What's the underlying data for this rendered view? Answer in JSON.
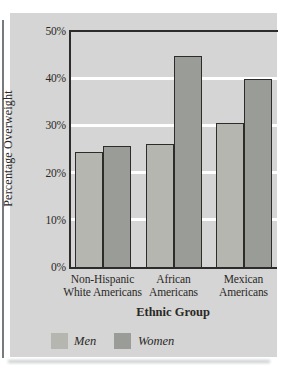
{
  "figure": {
    "y_axis_title": "Percentage Overweight",
    "x_axis_title": "Ethnic Group"
  },
  "colors": {
    "panel_background": "#d4d5d4",
    "men_bar": "#b4b6af",
    "women_bar": "#9a9c97",
    "bar_outline": "#2d2c2a",
    "axis_line": "#2d2c2a",
    "gridline": "#ffffff",
    "text": "#2b2826"
  },
  "chart_data": {
    "type": "bar",
    "title": "",
    "categories": [
      "Non-Hispanic White Americans",
      "African Americans",
      "Mexican Americans"
    ],
    "category_label_lines": [
      [
        "Non-Hispanic",
        "White Americans"
      ],
      [
        "African",
        "Americans"
      ],
      [
        "Mexican",
        "Americans"
      ]
    ],
    "series": [
      {
        "name": "Men",
        "color": "#b4b6af",
        "values": [
          24.3,
          26.0,
          30.5
        ]
      },
      {
        "name": "Women",
        "color": "#9a9c97",
        "values": [
          25.6,
          44.7,
          39.8
        ]
      }
    ],
    "xlabel": "Ethnic Group",
    "ylabel": "Percentage Overweight",
    "ylim": [
      0,
      50
    ],
    "ytick_values": [
      0,
      10,
      20,
      30,
      40,
      50
    ],
    "ytick_labels": [
      "0%",
      "10%",
      "20%",
      "30%",
      "40%",
      "50%"
    ],
    "gridline_values": [
      10,
      20,
      30,
      40
    ],
    "grid": "horizontal white gridlines",
    "legend_position": "bottom-left"
  }
}
